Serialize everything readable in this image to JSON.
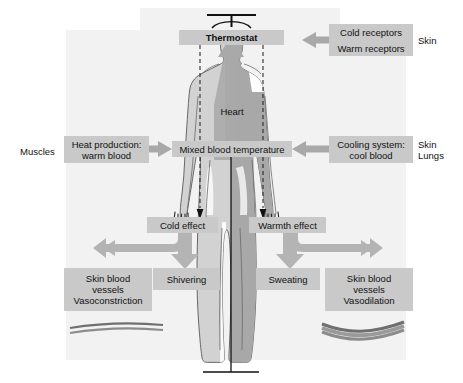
{
  "diagram": {
    "type": "physiology-flow-diagram",
    "colors": {
      "box_fill": "#c9c9c9",
      "arrow_fill": "#b0b0b0",
      "body_outline": "#4a4a4a",
      "body_light": "#d2d2d2",
      "body_core": "#a8a8a8",
      "background_panel": "#f2f2f2",
      "text": "#111111",
      "vessel": "#707070"
    }
  },
  "labels": {
    "hypothalamus": "Hypothalamus",
    "thermostat": "Thermostat",
    "heart": "Heart",
    "mixed_blood_temperature": "Mixed blood temperature",
    "cold_receptors": "Cold receptors",
    "warm_receptors": "Warm receptors",
    "skin_top": "Skin",
    "muscles": "Muscles",
    "heat_production": "Heat production:\nwarm blood",
    "cooling_system": "Cooling system:\ncool blood",
    "skin_lungs": "Skin\nLungs",
    "cold_effect": "Cold effect",
    "warmth_effect": "Warmth effect",
    "shivering": "Shivering",
    "sweating": "Sweating",
    "vasoconstriction": "Skin blood\nvessels\nVasoconstriction",
    "vasodilation": "Skin blood\nvessels\nVasodilation"
  },
  "icons": {
    "thermostat": "thermostat-dial-icon",
    "vessel_constricted": "narrow-blood-vessel-icon",
    "vessel_dilated": "wide-blood-vessel-icon",
    "body": "human-body-silhouette-icon"
  }
}
